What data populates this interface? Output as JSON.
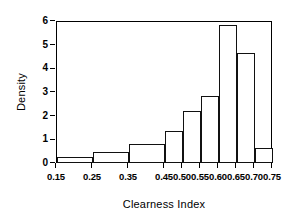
{
  "chart_data": {
    "type": "bar",
    "title": "",
    "subtitle": "",
    "xlabel": "Clearness Index",
    "ylabel": "Density",
    "xlim": [
      0.15,
      0.75
    ],
    "ylim": [
      0,
      6
    ],
    "grid": false,
    "legend": null,
    "x_tick_labels": [
      "0.15",
      "0.25",
      "0.35",
      "0.45",
      "0.50",
      "0.55",
      "0.60",
      "0.65",
      "0.70",
      "0.75"
    ],
    "x_tick_values": [
      0.15,
      0.25,
      0.35,
      0.45,
      0.5,
      0.55,
      0.6,
      0.65,
      0.7,
      0.75
    ],
    "y_tick_labels": [
      "0",
      "1",
      "2",
      "3",
      "4",
      "5",
      "6"
    ],
    "y_tick_values": [
      0,
      1,
      2,
      3,
      4,
      5,
      6
    ],
    "bin_edges": [
      0.15,
      0.25,
      0.35,
      0.45,
      0.5,
      0.55,
      0.6,
      0.65,
      0.7,
      0.75
    ],
    "categories": [
      "0.15-0.25",
      "0.25-0.35",
      "0.35-0.45",
      "0.45-0.50",
      "0.50-0.55",
      "0.55-0.60",
      "0.60-0.65",
      "0.65-0.70",
      "0.70-0.75"
    ],
    "values": [
      0.2,
      0.42,
      0.78,
      1.3,
      2.15,
      2.8,
      5.8,
      4.6,
      0.6
    ]
  }
}
